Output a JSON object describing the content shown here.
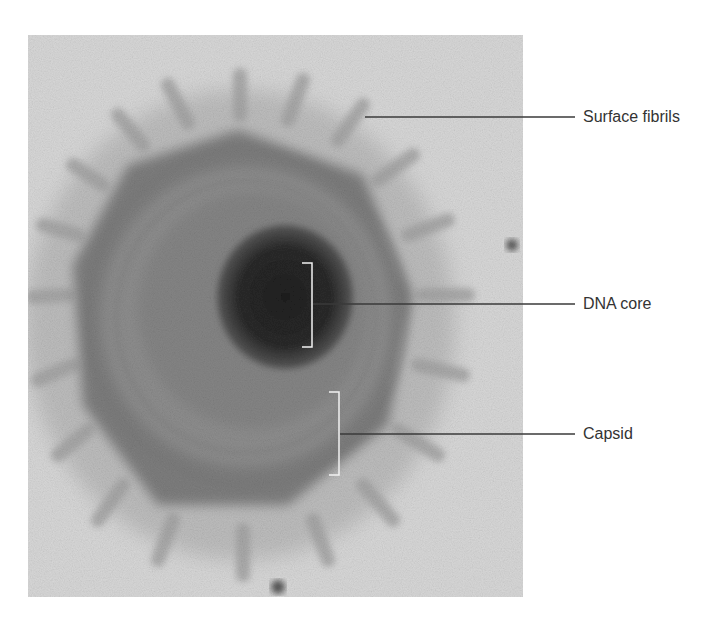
{
  "figure": {
    "type": "electron micrograph",
    "labels": [
      {
        "id": "surface-fibrils",
        "text": "Surface fibrils"
      },
      {
        "id": "dna-core",
        "text": "DNA core"
      },
      {
        "id": "capsid",
        "text": "Capsid"
      }
    ]
  },
  "colors": {
    "background": "#ffffff",
    "micrograph_bg": "#d6d6d6",
    "fibrils": "#a8a8a8",
    "capsid_outer": "#7c7c7c",
    "capsid_inner": "#8f8f8f",
    "core": "#2a2a2a",
    "leader_line": "#3a3a3a",
    "bracket": "#f2f2f2",
    "label_text": "#333333"
  }
}
